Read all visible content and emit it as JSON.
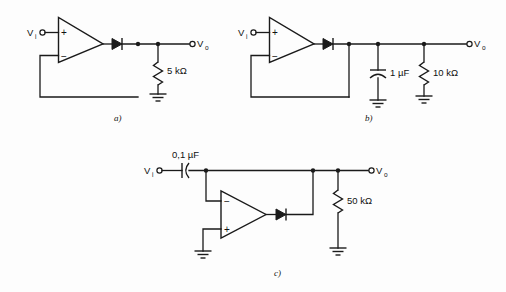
{
  "figure": {
    "background_color": "#fdfdfd",
    "ink_color": "#1a1a1a",
    "title": "",
    "circuits": [
      {
        "id": "a",
        "caption": "a)",
        "input_label": "V",
        "input_sub": "i",
        "output_label": "V",
        "output_sub": "o",
        "opamp": {
          "top_input_sign": "+",
          "bottom_input_sign": "−",
          "configuration": "non-inverting-buffer"
        },
        "diode": "diode-symbol",
        "components": [
          {
            "kind": "resistor",
            "value": "5 kΩ"
          }
        ],
        "ground_count": 1
      },
      {
        "id": "b",
        "caption": "b)",
        "input_label": "V",
        "input_sub": "i",
        "output_label": "V",
        "output_sub": "o",
        "opamp": {
          "top_input_sign": "+",
          "bottom_input_sign": "−",
          "configuration": "non-inverting-buffer"
        },
        "diode": "diode-symbol",
        "components": [
          {
            "kind": "capacitor",
            "value": "1 µF"
          },
          {
            "kind": "resistor",
            "value": "10 kΩ"
          }
        ],
        "ground_count": 2
      },
      {
        "id": "c",
        "caption": "c)",
        "input_label": "V",
        "input_sub": "i",
        "output_label": "V",
        "output_sub": "o",
        "opamp": {
          "top_input_sign": "−",
          "bottom_input_sign": "+",
          "configuration": "inverting-feedback"
        },
        "diode": "diode-symbol",
        "components": [
          {
            "kind": "capacitor",
            "value": "0,1 µF"
          },
          {
            "kind": "resistor",
            "value": "50 kΩ"
          }
        ],
        "ground_count": 2
      }
    ]
  }
}
